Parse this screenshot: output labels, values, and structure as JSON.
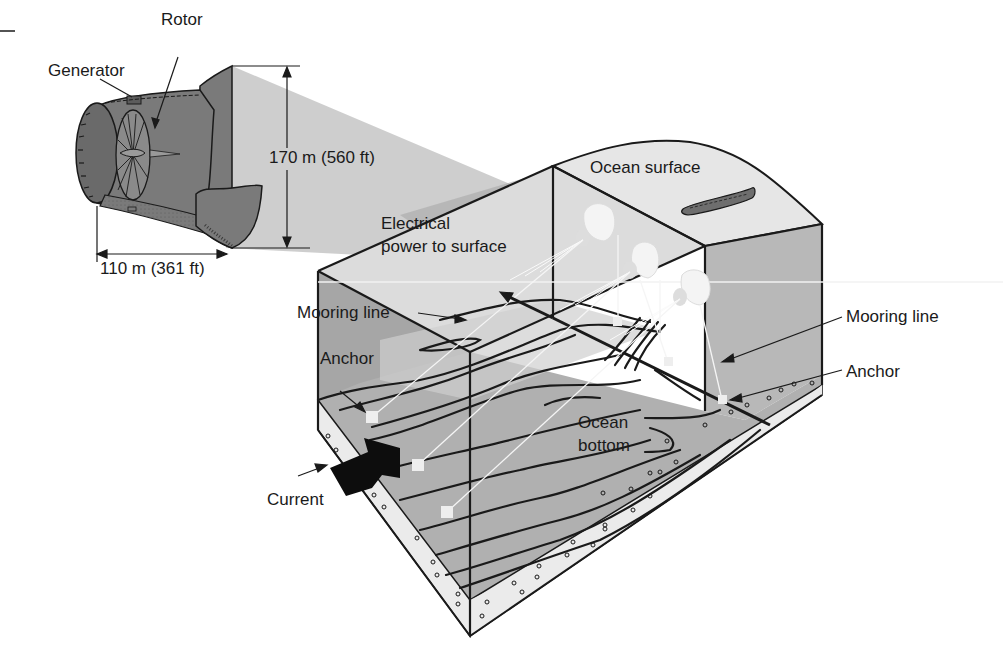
{
  "diagram": {
    "colors": {
      "ink": "#1a1a1a",
      "turbine_body": "#7a7a7a",
      "turbine_dark": "#5c5c5c",
      "beam": "#c9c9c9",
      "beam_dark": "#a9a9a9",
      "surface": "#e6e6e6",
      "side_face": "#b8b8b8",
      "seafloor": "#b0b0b0",
      "seafloor_light": "#d4d4d4",
      "sediment": "#ebebeb",
      "ship": "#6e6e6e",
      "anchor": "#eeeeee"
    },
    "labels": {
      "rotor": "Rotor",
      "generator": "Generator",
      "height_dim": "170 m (560 ft)",
      "length_dim": "110 m (361 ft)",
      "ocean_surface": "Ocean surface",
      "electrical_line1": "Electrical",
      "electrical_line2": "power to surface",
      "mooring_line_left": "Mooring line",
      "mooring_line_right": "Mooring line",
      "anchor_left": "Anchor",
      "anchor_right": "Anchor",
      "current": "Current",
      "ocean_bottom_line1": "Ocean",
      "ocean_bottom_line2": "bottom"
    },
    "turbines_in_farm": 3,
    "anchors_visible": 6
  }
}
